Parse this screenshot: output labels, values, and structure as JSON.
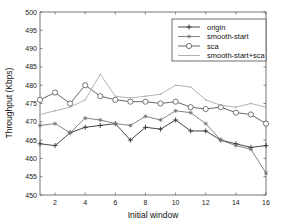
{
  "chart_data": {
    "type": "line",
    "title": "",
    "xlabel": "Initial window",
    "ylabel": "Throughput (Kbps)",
    "xlim": [
      1,
      16
    ],
    "ylim": [
      450,
      500
    ],
    "xticks": [
      2,
      4,
      6,
      8,
      10,
      12,
      14,
      16
    ],
    "yticks": [
      450,
      455,
      460,
      465,
      470,
      475,
      480,
      485,
      490,
      495,
      500
    ],
    "grid": false,
    "legend_position": "upper right",
    "x": [
      1,
      2,
      3,
      4,
      5,
      6,
      7,
      8,
      9,
      10,
      11,
      12,
      13,
      14,
      15,
      16
    ],
    "series": [
      {
        "name": "origin",
        "marker": "+",
        "color": "#333333",
        "values": [
          464,
          463.5,
          467,
          468.5,
          469,
          469.5,
          465,
          468.5,
          468,
          470.5,
          467.5,
          467.5,
          465,
          464,
          463,
          463.5
        ]
      },
      {
        "name": "smooth-start",
        "marker": "*",
        "color": "#777777",
        "values": [
          469,
          469.5,
          467,
          471,
          470.5,
          469.5,
          469,
          471.5,
          470.5,
          473,
          472.5,
          469.5,
          465,
          463.5,
          462.5,
          456
        ]
      },
      {
        "name": "sca",
        "marker": "o",
        "color": "#555555",
        "values": [
          476,
          478,
          475,
          480,
          477,
          476,
          475.5,
          475.5,
          475,
          475.5,
          474,
          473.5,
          474,
          472.5,
          472,
          469.5
        ]
      },
      {
        "name": "smooth-start+sca",
        "marker": ".",
        "color": "#aaaaaa",
        "values": [
          472,
          473,
          474,
          476,
          483,
          477,
          476.5,
          477,
          477.5,
          480,
          479.5,
          476,
          474.5,
          474,
          475,
          474
        ]
      }
    ]
  }
}
